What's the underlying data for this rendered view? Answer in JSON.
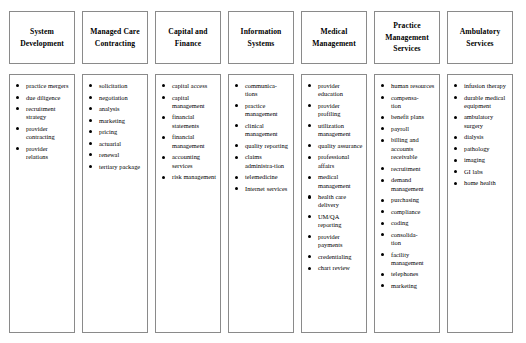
{
  "diagram": {
    "type": "organizational-service-categories",
    "colors": {
      "border": "#8a8a8a",
      "text": "#000000",
      "background": "#ffffff",
      "bullet": "#000000"
    },
    "columns": [
      {
        "id": "system-development",
        "title": "System Development",
        "items": [
          "practice mergers",
          "due diligence",
          "recruitment strategy",
          "provider contracting",
          "provider relations"
        ]
      },
      {
        "id": "managed-care-contracting",
        "title": "Managed Care Contracting",
        "items": [
          "solicitation",
          "negotiation",
          "analysis",
          "marketing",
          "pricing",
          "actuarial",
          "renewal",
          "tertiary package"
        ]
      },
      {
        "id": "capital-and-finance",
        "title": "Capital and Finance",
        "items": [
          "capital access",
          "capital management",
          "financial statements",
          "financial management",
          "accounting services",
          "risk management"
        ]
      },
      {
        "id": "information-systems",
        "title": "Information Systems",
        "items": [
          "communica-tions",
          "practice management",
          "clinical management",
          "quality reporting",
          "claims administra-tion",
          "telemedicine",
          "Internet services"
        ]
      },
      {
        "id": "medical-management",
        "title": "Medical Management",
        "items": [
          "provider education",
          "provider profiling",
          "utilization management",
          "quality assurance",
          "professional affairs",
          "medical management",
          "health care delivery",
          "UM/QA reporting",
          "provider payments",
          "credentialing",
          "chart review"
        ]
      },
      {
        "id": "practice-management-services",
        "title": "Practice Management Services",
        "items": [
          "human resources",
          "compensa-tion",
          "benefit plans",
          "payroll",
          "billing and accounts receivable",
          "recruitment",
          "demand management",
          "purchasing",
          "compliance",
          "coding",
          "consolida-tion",
          "facility management",
          "telephones",
          "marketing"
        ]
      },
      {
        "id": "ambulatory-services",
        "title": "Ambulatory Services",
        "items": [
          "infusion therapy",
          "durable medical equipment",
          "ambulatory surgery",
          "dialysis",
          "pathology",
          "imaging",
          "GI labs",
          "home health"
        ]
      }
    ]
  }
}
